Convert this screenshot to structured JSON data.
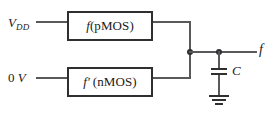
{
  "diagram": {
    "type": "circuit-schematic",
    "colors": {
      "wire": "#59595b",
      "box_border": "#2f2f31",
      "text": "#1a1a1a",
      "background": "#ffffff"
    },
    "supply_rail": {
      "name": "V_DD",
      "symbol": "V",
      "subscript": "DD"
    },
    "ground_rail": {
      "name": "0 V",
      "value": "0",
      "unit": "V"
    },
    "blocks": [
      {
        "id": "pmos-block",
        "function": "f",
        "prime": "",
        "network": "(pMOS)"
      },
      {
        "id": "nmos-block",
        "function": "f",
        "prime": "′",
        "network": "(nMOS)"
      }
    ],
    "output": {
      "label": "f"
    },
    "capacitor": {
      "label": "C"
    },
    "nodes": [
      {
        "id": "pull-node",
        "label": ""
      },
      {
        "id": "output-node",
        "label": ""
      }
    ]
  }
}
